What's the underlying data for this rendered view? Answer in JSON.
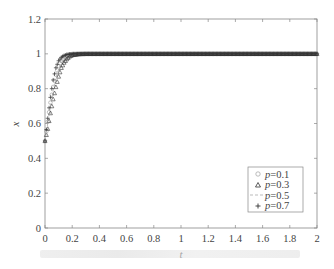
{
  "chart_data": {
    "type": "line",
    "title": "",
    "xlabel": "t",
    "ylabel": "x",
    "xlim": [
      0,
      2
    ],
    "ylim": [
      0,
      1.2
    ],
    "xticks": [
      "0",
      "0.2",
      "0.4",
      "0.6",
      "0.8",
      "1",
      "1.2",
      "1.4",
      "1.6",
      "1.8",
      "2"
    ],
    "yticks": [
      "0",
      "0.2",
      "0.4",
      "0.6",
      "0.8",
      "1",
      "1.2"
    ],
    "grid": false,
    "legend_position": "lower right",
    "series": [
      {
        "name": "p=0.1",
        "marker": "circle",
        "x": [
          0,
          0.02,
          0.04,
          0.06,
          0.08,
          0.1,
          0.12,
          0.14,
          0.16,
          0.18,
          0.2,
          0.25,
          0.3,
          0.5,
          1,
          1.5,
          2
        ],
        "values": [
          0.5,
          0.61,
          0.72,
          0.81,
          0.88,
          0.93,
          0.96,
          0.98,
          0.99,
          0.995,
          0.998,
          1,
          1,
          1,
          1,
          1,
          1
        ]
      },
      {
        "name": "p=0.3",
        "marker": "triangle",
        "x": [
          0,
          0.02,
          0.04,
          0.06,
          0.08,
          0.1,
          0.12,
          0.14,
          0.16,
          0.18,
          0.2,
          0.25,
          0.3,
          0.5,
          1,
          1.5,
          2
        ],
        "values": [
          0.5,
          0.57,
          0.66,
          0.74,
          0.81,
          0.87,
          0.92,
          0.95,
          0.97,
          0.985,
          0.993,
          0.999,
          1,
          1,
          1,
          1,
          1
        ]
      },
      {
        "name": "p=0.5",
        "marker": "dashed",
        "x": [
          0,
          0.02,
          0.04,
          0.06,
          0.08,
          0.1,
          0.12,
          0.14,
          0.16,
          0.18,
          0.2,
          0.25,
          0.3,
          0.5,
          1,
          1.5,
          2
        ],
        "values": [
          0.5,
          0.6,
          0.7,
          0.79,
          0.86,
          0.91,
          0.95,
          0.97,
          0.985,
          0.993,
          0.997,
          1,
          1,
          1,
          1,
          1,
          1
        ]
      },
      {
        "name": "p=0.7",
        "marker": "plus",
        "x": [
          0,
          0.02,
          0.04,
          0.06,
          0.08,
          0.1,
          0.12,
          0.14,
          0.16,
          0.18,
          0.2,
          0.25,
          0.3,
          0.5,
          1,
          1.5,
          2
        ],
        "values": [
          0.5,
          0.63,
          0.75,
          0.85,
          0.92,
          0.96,
          0.98,
          0.99,
          0.996,
          0.998,
          1,
          1,
          1,
          1,
          1,
          1,
          1
        ]
      }
    ]
  },
  "legend": {
    "items": [
      {
        "label": "p=0.1",
        "symbol": "○"
      },
      {
        "label": "p=0.3",
        "symbol": "△"
      },
      {
        "label": "p=0.5",
        "symbol": "- - -"
      },
      {
        "label": "p=0.7",
        "symbol": "+"
      }
    ]
  },
  "axes": {
    "xlabel": "t",
    "ylabel": "x"
  },
  "colors": {
    "axis": "#888888",
    "marker": "#333333",
    "dashed": "#aaaaaa"
  }
}
